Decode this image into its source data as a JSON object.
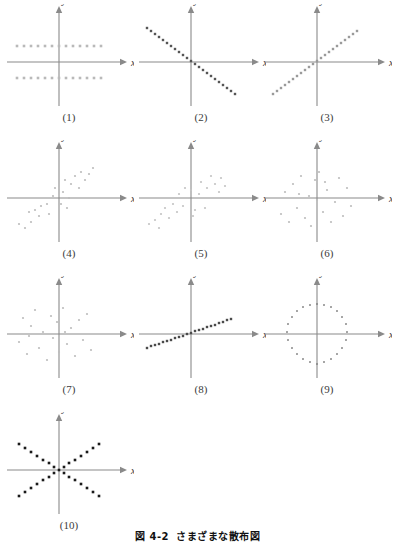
{
  "figure": {
    "caption_number": "図 4-2",
    "caption_text": "さまざまな散布図",
    "axis_label_x": "x",
    "axis_label_y": "y"
  },
  "panels": [
    {
      "label": "(1)",
      "pattern": "two-horizontal-bands",
      "dot_color": "#b9b9b9",
      "dot_shape": "square",
      "dot_size": 2.6,
      "points": [
        [
          -42,
          16
        ],
        [
          -35,
          16
        ],
        [
          -28,
          16
        ],
        [
          -21,
          16
        ],
        [
          -14,
          16
        ],
        [
          -7,
          16
        ],
        [
          0,
          16
        ],
        [
          7,
          16
        ],
        [
          14,
          16
        ],
        [
          21,
          16
        ],
        [
          28,
          16
        ],
        [
          35,
          16
        ],
        [
          42,
          16
        ],
        [
          -42,
          -16
        ],
        [
          -35,
          -16
        ],
        [
          -28,
          -16
        ],
        [
          -21,
          -16
        ],
        [
          -14,
          -16
        ],
        [
          -7,
          -16
        ],
        [
          0,
          -16
        ],
        [
          7,
          -16
        ],
        [
          14,
          -16
        ],
        [
          21,
          -16
        ],
        [
          28,
          -16
        ],
        [
          35,
          -16
        ],
        [
          42,
          -16
        ]
      ]
    },
    {
      "label": "(2)",
      "pattern": "negative-linear",
      "dot_color": "#555555",
      "dot_shape": "square",
      "dot_size": 2.4,
      "points": [
        [
          -44,
          34
        ],
        [
          -40,
          31
        ],
        [
          -36,
          28
        ],
        [
          -32,
          25
        ],
        [
          -28,
          22
        ],
        [
          -24,
          19
        ],
        [
          -20,
          16
        ],
        [
          -16,
          13
        ],
        [
          -12,
          10
        ],
        [
          -8,
          7
        ],
        [
          -4,
          4
        ],
        [
          0,
          1
        ],
        [
          4,
          -2
        ],
        [
          8,
          -5
        ],
        [
          12,
          -8
        ],
        [
          16,
          -11
        ],
        [
          20,
          -14
        ],
        [
          24,
          -17
        ],
        [
          28,
          -20
        ],
        [
          32,
          -23
        ],
        [
          36,
          -26
        ],
        [
          40,
          -29
        ],
        [
          44,
          -32
        ]
      ]
    },
    {
      "label": "(3)",
      "pattern": "positive-linear",
      "dot_color": "#9a9a9a",
      "dot_shape": "square",
      "dot_size": 2.4,
      "points": [
        [
          -44,
          -32
        ],
        [
          -40,
          -29
        ],
        [
          -36,
          -26
        ],
        [
          -32,
          -23
        ],
        [
          -28,
          -20
        ],
        [
          -24,
          -17
        ],
        [
          -20,
          -14
        ],
        [
          -16,
          -11
        ],
        [
          -12,
          -8
        ],
        [
          -8,
          -5
        ],
        [
          -4,
          -2
        ],
        [
          0,
          1
        ],
        [
          4,
          4
        ],
        [
          8,
          7
        ],
        [
          12,
          10
        ],
        [
          16,
          13
        ],
        [
          20,
          16
        ],
        [
          24,
          19
        ],
        [
          28,
          22
        ],
        [
          32,
          25
        ],
        [
          36,
          28
        ],
        [
          40,
          31
        ]
      ]
    },
    {
      "label": "(4)",
      "pattern": "positive-scatter",
      "dot_color": "#bdbdbd",
      "dot_shape": "circle",
      "dot_size": 2.2,
      "points": [
        [
          -40,
          -26
        ],
        [
          -34,
          -30
        ],
        [
          -28,
          -24
        ],
        [
          -30,
          -14
        ],
        [
          -24,
          -12
        ],
        [
          -20,
          -18
        ],
        [
          -18,
          -8
        ],
        [
          -12,
          -6
        ],
        [
          -10,
          -16
        ],
        [
          -6,
          2
        ],
        [
          -4,
          10
        ],
        [
          2,
          -6
        ],
        [
          4,
          6
        ],
        [
          6,
          18
        ],
        [
          10,
          0
        ],
        [
          12,
          14
        ],
        [
          16,
          22
        ],
        [
          20,
          10
        ],
        [
          22,
          26
        ],
        [
          26,
          18
        ],
        [
          30,
          24
        ],
        [
          34,
          30
        ],
        [
          8,
          -10
        ]
      ]
    },
    {
      "label": "(5)",
      "pattern": "positive-scatter-diffuse",
      "dot_color": "#c4c4c4",
      "dot_shape": "circle",
      "dot_size": 2.2,
      "points": [
        [
          -42,
          -26
        ],
        [
          -36,
          -22
        ],
        [
          -32,
          -30
        ],
        [
          -30,
          -16
        ],
        [
          -26,
          -10
        ],
        [
          -22,
          -20
        ],
        [
          -18,
          -6
        ],
        [
          -14,
          -14
        ],
        [
          -12,
          4
        ],
        [
          -8,
          -8
        ],
        [
          -6,
          10
        ],
        [
          -2,
          0
        ],
        [
          0,
          8
        ],
        [
          4,
          -12
        ],
        [
          8,
          4
        ],
        [
          10,
          16
        ],
        [
          14,
          -10
        ],
        [
          16,
          10
        ],
        [
          20,
          22
        ],
        [
          24,
          14
        ],
        [
          28,
          6
        ],
        [
          30,
          20
        ],
        [
          34,
          12
        ],
        [
          2,
          -18
        ]
      ]
    },
    {
      "label": "(6)",
      "pattern": "random-scatter",
      "dot_color": "#bdbdbd",
      "dot_shape": "circle",
      "dot_size": 2.2,
      "points": [
        [
          -36,
          -16
        ],
        [
          -32,
          6
        ],
        [
          -28,
          -24
        ],
        [
          -24,
          14
        ],
        [
          -20,
          -10
        ],
        [
          -16,
          22
        ],
        [
          -12,
          -20
        ],
        [
          -8,
          2
        ],
        [
          -6,
          -28
        ],
        [
          -2,
          18
        ],
        [
          0,
          -2
        ],
        [
          2,
          26
        ],
        [
          6,
          -14
        ],
        [
          10,
          8
        ],
        [
          14,
          -24
        ],
        [
          18,
          -4
        ],
        [
          22,
          20
        ],
        [
          26,
          -18
        ],
        [
          30,
          10
        ],
        [
          34,
          -8
        ],
        [
          -18,
          4
        ],
        [
          8,
          16
        ]
      ]
    },
    {
      "label": "(7)",
      "pattern": "random-scatter",
      "dot_color": "#bdbdbd",
      "dot_shape": "circle",
      "dot_size": 2.2,
      "points": [
        [
          -40,
          -8
        ],
        [
          -36,
          16
        ],
        [
          -32,
          -20
        ],
        [
          -28,
          8
        ],
        [
          -24,
          24
        ],
        [
          -20,
          -14
        ],
        [
          -16,
          2
        ],
        [
          -12,
          -26
        ],
        [
          -8,
          18
        ],
        [
          -6,
          -4
        ],
        [
          -2,
          12
        ],
        [
          0,
          -18
        ],
        [
          4,
          26
        ],
        [
          8,
          -10
        ],
        [
          12,
          6
        ],
        [
          16,
          -22
        ],
        [
          20,
          14
        ],
        [
          24,
          -6
        ],
        [
          28,
          20
        ],
        [
          32,
          -16
        ],
        [
          -30,
          -2
        ],
        [
          6,
          2
        ]
      ]
    },
    {
      "label": "(8)",
      "pattern": "positive-linear-shallow",
      "dot_color": "#4a4a4a",
      "dot_shape": "square",
      "dot_size": 2.4,
      "points": [
        [
          -44,
          -14
        ],
        [
          -40,
          -12
        ],
        [
          -36,
          -11
        ],
        [
          -32,
          -10
        ],
        [
          -28,
          -8
        ],
        [
          -24,
          -7
        ],
        [
          -20,
          -6
        ],
        [
          -16,
          -4
        ],
        [
          -12,
          -3
        ],
        [
          -8,
          -2
        ],
        [
          -4,
          0
        ],
        [
          0,
          1
        ],
        [
          4,
          3
        ],
        [
          8,
          4
        ],
        [
          12,
          5
        ],
        [
          16,
          7
        ],
        [
          20,
          8
        ],
        [
          24,
          9
        ],
        [
          28,
          11
        ],
        [
          32,
          12
        ],
        [
          36,
          14
        ],
        [
          40,
          15
        ]
      ]
    },
    {
      "label": "(9)",
      "pattern": "circular-ring",
      "dot_color": "#808080",
      "dot_shape": "circle",
      "dot_size": 1.9,
      "points": [
        [
          0,
          30
        ],
        [
          7,
          29
        ],
        [
          14,
          27
        ],
        [
          20,
          23
        ],
        [
          25,
          17
        ],
        [
          29,
          10
        ],
        [
          30,
          2
        ],
        [
          29,
          -6
        ],
        [
          25,
          -14
        ],
        [
          20,
          -20
        ],
        [
          14,
          -25
        ],
        [
          7,
          -28
        ],
        [
          0,
          -30
        ],
        [
          -7,
          -28
        ],
        [
          -14,
          -25
        ],
        [
          -20,
          -20
        ],
        [
          -25,
          -14
        ],
        [
          -29,
          -6
        ],
        [
          -30,
          2
        ],
        [
          -29,
          10
        ],
        [
          -25,
          17
        ],
        [
          -20,
          23
        ],
        [
          -14,
          27
        ],
        [
          -7,
          29
        ]
      ]
    },
    {
      "label": "(10)",
      "pattern": "x-cross",
      "dot_color": "#1a1a1a",
      "dot_shape": "square",
      "dot_size": 2.6,
      "points": [
        [
          -40,
          26
        ],
        [
          -34,
          22
        ],
        [
          -28,
          18
        ],
        [
          -22,
          14
        ],
        [
          -16,
          10
        ],
        [
          -10,
          7
        ],
        [
          -5,
          3
        ],
        [
          0,
          0
        ],
        [
          5,
          -3
        ],
        [
          10,
          -7
        ],
        [
          16,
          -10
        ],
        [
          22,
          -14
        ],
        [
          28,
          -18
        ],
        [
          34,
          -22
        ],
        [
          40,
          -26
        ],
        [
          -40,
          -26
        ],
        [
          -34,
          -22
        ],
        [
          -28,
          -18
        ],
        [
          -22,
          -14
        ],
        [
          -16,
          -10
        ],
        [
          -10,
          -7
        ],
        [
          -5,
          -3
        ],
        [
          5,
          3
        ],
        [
          10,
          7
        ],
        [
          16,
          10
        ],
        [
          22,
          14
        ],
        [
          28,
          18
        ],
        [
          34,
          22
        ],
        [
          40,
          26
        ]
      ]
    }
  ],
  "layout": {
    "positions": [
      {
        "left": 4,
        "top": 4
      },
      {
        "left": 136,
        "top": 4
      },
      {
        "left": 262,
        "top": 4
      },
      {
        "left": 4,
        "top": 140
      },
      {
        "left": 136,
        "top": 140
      },
      {
        "left": 262,
        "top": 140
      },
      {
        "left": 4,
        "top": 276
      },
      {
        "left": 136,
        "top": 276
      },
      {
        "left": 262,
        "top": 276
      },
      {
        "left": 4,
        "top": 412
      }
    ],
    "axis_color": "#8a8a8a",
    "origin": {
      "x": 55,
      "y": 58
    },
    "x_axis": {
      "from": -52,
      "to": 62
    },
    "y_axis": {
      "from": -44,
      "to": 50
    }
  }
}
